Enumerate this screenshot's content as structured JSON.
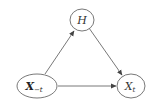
{
  "diagram": {
    "type": "causal-graph",
    "nodes": [
      {
        "id": "H",
        "label": "H",
        "subscript": ""
      },
      {
        "id": "X_minus_t",
        "label": "X",
        "subscript": "−t",
        "bold": true
      },
      {
        "id": "X_t",
        "label": "X",
        "subscript": "t",
        "bold": false
      }
    ],
    "edges": [
      {
        "from": "X_minus_t",
        "to": "H"
      },
      {
        "from": "H",
        "to": "X_t"
      },
      {
        "from": "X_minus_t",
        "to": "X_t"
      }
    ],
    "colors": {
      "stroke": "#555555",
      "text": "#333333",
      "background": "#ffffff"
    }
  }
}
